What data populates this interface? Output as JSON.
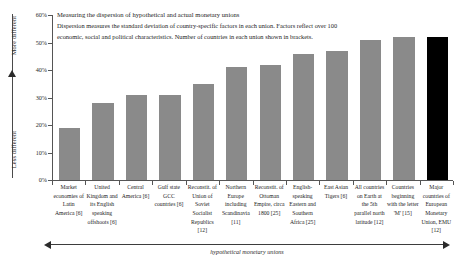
{
  "chart_data": {
    "type": "bar",
    "title": "Measuring the dispersion of hypothetical and actual monetary unions",
    "subtitle_line1": "Dispersion measures the standard deviation of country-specific factors in each union. Factors reflect over 100",
    "subtitle_line2": "economic, social and political characteristics. Number of countries in each union shown in brackets.",
    "xlabel": "hypothetical monetary unions",
    "ylabel_top": "More different",
    "ylabel_bottom": "Less different",
    "ylim": [
      0,
      60
    ],
    "ytick_labels": [
      "0%",
      "10%",
      "20%",
      "30%",
      "40%",
      "50%",
      "60%"
    ],
    "ytick_values": [
      0,
      10,
      20,
      30,
      40,
      50,
      60
    ],
    "grid": false,
    "legend": "none",
    "highlight_color": "#000000",
    "bar_color": "#8a8a8a",
    "categories": [
      "Market economies of Latin America [6]",
      "United Kingdom and its English speaking offshoots [6]",
      "Central America [6]",
      "Gulf state GCC countries [6]",
      "Reconstit. of Union of Soviet Socialist Republics [12]",
      "Northern Europe including Scandinavia [11]",
      "Reconstit. of Ottoman Empire, circa 1800 [25]",
      "English-speaking Eastern and Southern Africa [25]",
      "East Asian Tigers [6]",
      "All countries on Earth at the 5th parallel north latitude [12]",
      "Countries beginning with the letter 'M' [15]",
      "Major countries of European Monetary Union, EMU [12]"
    ],
    "values": [
      19,
      28,
      31,
      31,
      35,
      41,
      42,
      46,
      47,
      51,
      52,
      52
    ],
    "counts": [
      6,
      6,
      6,
      6,
      12,
      11,
      25,
      25,
      6,
      12,
      15,
      12
    ],
    "highlight_index": 11
  }
}
